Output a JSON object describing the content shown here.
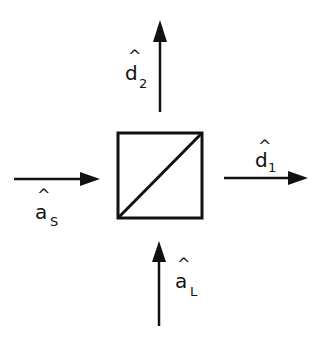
{
  "diagram": {
    "type": "beam-splitter",
    "stroke_color": "#111111",
    "background": "#ffffff",
    "element": {
      "name": "beam-splitter",
      "shape": "square-with-diagonal"
    },
    "ports": [
      {
        "id": "a_S",
        "direction": "in-from-left",
        "label": {
          "base": "a",
          "hat": "^",
          "sub": "S"
        }
      },
      {
        "id": "a_L",
        "direction": "in-from-bottom",
        "label": {
          "base": "a",
          "hat": "^",
          "sub": "L"
        }
      },
      {
        "id": "d_1",
        "direction": "out-to-right",
        "label": {
          "base": "d",
          "hat": "^",
          "sub": "1"
        }
      },
      {
        "id": "d_2",
        "direction": "out-to-top",
        "label": {
          "base": "d",
          "hat": "^",
          "sub": "2"
        }
      }
    ]
  }
}
